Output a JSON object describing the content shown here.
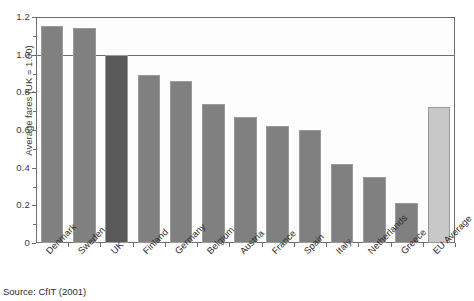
{
  "chart_data": {
    "type": "bar",
    "title": "",
    "xlabel": "",
    "ylabel": "Average fares (UK = 1.00)",
    "ylim": [
      0,
      1.2
    ],
    "yticks": [
      "0",
      "0.2",
      "0.4",
      "0.6",
      "0.8",
      "1.0",
      "1.2"
    ],
    "ytick_values": [
      0,
      0.2,
      0.4,
      0.6,
      0.8,
      1.0,
      1.2
    ],
    "grid": "horizontal line at 1.0 and frame at 1.2",
    "legend": "none",
    "categories": [
      "Denmark",
      "Sweden",
      "UK",
      "Finland",
      "Germany",
      "Belgium",
      "Austria",
      "France",
      "Spain",
      "Italy",
      "Netherlands",
      "Greece",
      "EU Average"
    ],
    "values": [
      1.15,
      1.14,
      1.0,
      0.89,
      0.86,
      0.74,
      0.67,
      0.62,
      0.6,
      0.42,
      0.35,
      0.21,
      0.72
    ],
    "bar_colors": [
      "#808080",
      "#808080",
      "#595959",
      "#808080",
      "#808080",
      "#808080",
      "#808080",
      "#808080",
      "#808080",
      "#808080",
      "#808080",
      "#808080",
      "#c8c8c8"
    ],
    "reference_line": 1.0,
    "source": "Source: CfIT (2001)"
  },
  "colors": {
    "bar_default": "#808080",
    "bar_highlight": "#595959",
    "bar_average": "#c8c8c8",
    "axis": "#6e6e6e",
    "text": "#2b2b2b"
  }
}
